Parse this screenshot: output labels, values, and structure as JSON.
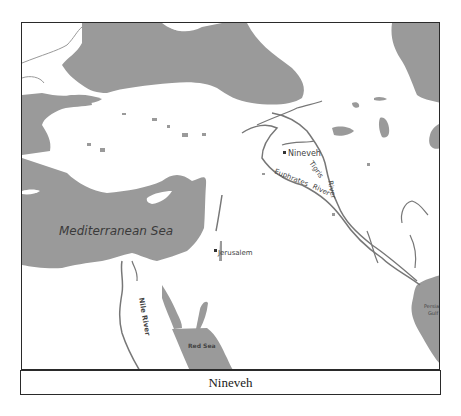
{
  "map": {
    "colors": {
      "water": "#9a9a9a",
      "land": "#ffffff",
      "river": "#777777",
      "border": "#2a2a2a",
      "label": "#444444"
    },
    "labels": {
      "mediterranean": "Mediterranean Sea",
      "jerusalem": "Jerusalem",
      "nineveh": "Nineveh",
      "tigris": "Tigris River",
      "euphrates": "Euphrates River",
      "euphrates_word1": "Euphrates",
      "euphrates_word2": "River",
      "tigris_word1": "Tigris",
      "tigris_word2": "River",
      "red_sea": "Red Sea",
      "persian_gulf_word1": "Persian",
      "persian_gulf_word2": "Gulf",
      "nile": "Nile River"
    }
  },
  "caption": {
    "text": "Nineveh"
  }
}
